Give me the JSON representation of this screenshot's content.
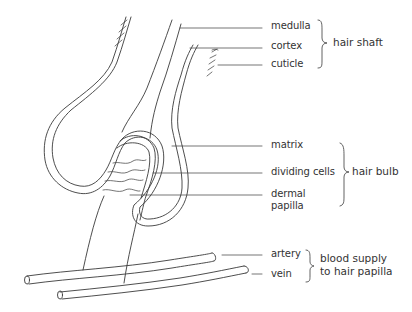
{
  "diagram": {
    "labels": {
      "medulla": "medulla",
      "cortex": "cortex",
      "cuticle": "cuticle",
      "matrix": "matrix",
      "dividing_cells": "dividing cells",
      "dermal_papilla_line1": "dermal",
      "dermal_papilla_line2": "papilla",
      "artery": "artery",
      "vein": "vein"
    },
    "groups": {
      "hair_shaft": "hair shaft",
      "hair_bulb": "hair bulb",
      "blood_supply_line1": "blood supply",
      "blood_supply_line2": "to hair papilla"
    },
    "colors": {
      "line": "#3a3a3a",
      "text": "#333333",
      "background": "#ffffff"
    }
  }
}
